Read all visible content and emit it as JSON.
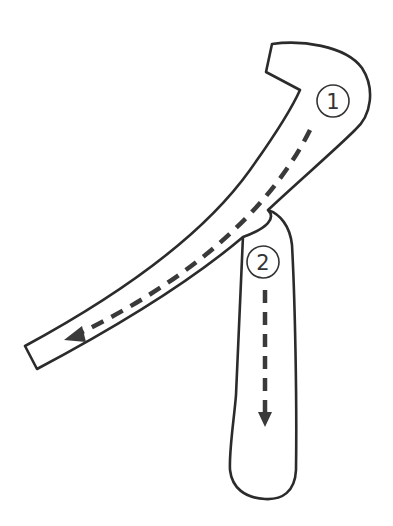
{
  "diagram": {
    "type": "stroke-order",
    "strokes": [
      {
        "order": "1",
        "label": "①",
        "direction": "down-left sweep"
      },
      {
        "order": "2",
        "label": "②",
        "direction": "vertical down"
      }
    ],
    "colors": {
      "outline": "#2b2b2b",
      "arrow": "#3a3a3a",
      "background": "#ffffff"
    }
  }
}
